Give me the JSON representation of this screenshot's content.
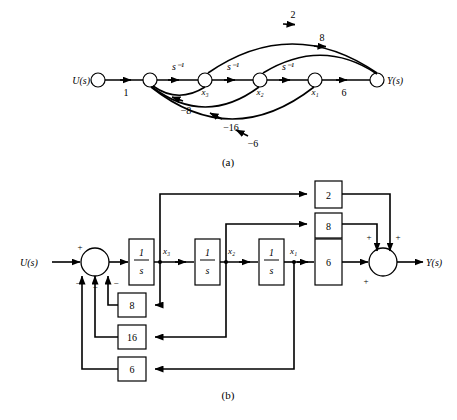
{
  "figure": {
    "panels": [
      {
        "id": "a",
        "caption": "(a)",
        "type": "signal-flow-graph",
        "input_label": "U(s)",
        "output_label": "Y(s)",
        "nodes": [
          {
            "name": "input",
            "label": "U(s)"
          },
          {
            "name": "sum",
            "label": ""
          },
          {
            "name": "x3",
            "label": "x₃"
          },
          {
            "name": "x2",
            "label": "x₂"
          },
          {
            "name": "x1",
            "label": "x₁"
          },
          {
            "name": "output",
            "label": "Y(s)"
          }
        ],
        "forward_branches": [
          {
            "name": "input-gain",
            "label": "1"
          },
          {
            "name": "integrator-1",
            "label": "s⁻¹"
          },
          {
            "name": "integrator-2",
            "label": "s⁻¹"
          },
          {
            "name": "integrator-3",
            "label": "s⁻¹"
          },
          {
            "name": "output-gain",
            "label": "6"
          }
        ],
        "feedforward_branches": [
          {
            "name": "gain-2",
            "label": "2"
          },
          {
            "name": "gain-8",
            "label": "8"
          }
        ],
        "feedback_branches": [
          {
            "name": "gain-neg-8",
            "label": "−8"
          },
          {
            "name": "gain-neg-16",
            "label": "−16"
          },
          {
            "name": "gain-neg-6",
            "label": "−6"
          }
        ]
      },
      {
        "id": "b",
        "caption": "(b)",
        "type": "block-diagram",
        "input_label": "U(s)",
        "output_label": "Y(s)",
        "integrators": [
          {
            "name": "integrator-1",
            "numerator": "1",
            "denominator": "s",
            "output_label": "x₃"
          },
          {
            "name": "integrator-2",
            "numerator": "1",
            "denominator": "s",
            "output_label": "x₂"
          },
          {
            "name": "integrator-3",
            "numerator": "1",
            "denominator": "s",
            "output_label": "x₁"
          }
        ],
        "feedforward_gains": [
          {
            "name": "gain-2",
            "label": "2"
          },
          {
            "name": "gain-8",
            "label": "8"
          },
          {
            "name": "gain-6",
            "label": "6"
          }
        ],
        "feedback_gains": [
          {
            "name": "gain-8",
            "label": "8"
          },
          {
            "name": "gain-16",
            "label": "16"
          },
          {
            "name": "gain-6",
            "label": "6"
          }
        ],
        "input_summer_signs": [
          {
            "name": "plus-input",
            "label": "+"
          },
          {
            "name": "minus-1",
            "label": "−"
          },
          {
            "name": "minus-2",
            "label": "−"
          },
          {
            "name": "minus-3",
            "label": "−"
          }
        ],
        "output_summer_signs": [
          {
            "name": "plus-1",
            "label": "+"
          },
          {
            "name": "plus-2",
            "label": "+"
          },
          {
            "name": "plus-3",
            "label": "+"
          }
        ]
      }
    ]
  }
}
